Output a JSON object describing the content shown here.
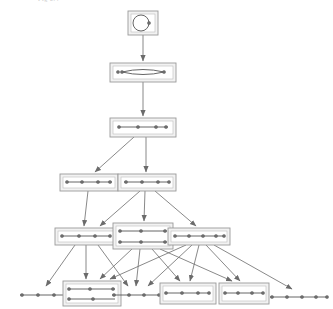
{
  "figure": {
    "type": "hierarchical-graph-lattice",
    "title_fragment": "Fig 2.4",
    "background_color": "#ffffff",
    "node_fill": "#f2f2f2",
    "node_stroke": "#9a9a9a",
    "graph_stroke": "#555555",
    "vertex_fill": "#6e6e6e",
    "edge_color": "#6b6b6b",
    "levels": 6,
    "node_count": 14,
    "edge_count": 25
  },
  "nodes": [
    {
      "id": "n0",
      "label": "level-0-single-vertex-graph",
      "level": 0,
      "x": 128,
      "y": 11,
      "w": 30,
      "h": 24,
      "kind": "cycle",
      "vertices": 2,
      "inner": {
        "type": "ellipse",
        "cx": 13,
        "cy": 12,
        "rx": 8,
        "ry": 8
      },
      "dots": [
        [
          21,
          12
        ]
      ]
    },
    {
      "id": "n1",
      "label": "level-1-lens-graph",
      "level": 1,
      "x": 110,
      "y": 63,
      "w": 66,
      "h": 19,
      "kind": "lens",
      "vertices": 3,
      "inner": {
        "type": "lens",
        "x1": 12,
        "x2": 54,
        "cy": 9,
        "ry": 5
      },
      "dots": [
        [
          12,
          9
        ],
        [
          54,
          9
        ],
        [
          8,
          9
        ]
      ]
    },
    {
      "id": "n2",
      "label": "level-2-path-graph",
      "level": 2,
      "x": 110,
      "y": 118,
      "w": 66,
      "h": 19,
      "kind": "path",
      "vertices": 4,
      "inner": {
        "type": "path",
        "y": 9,
        "x1": 8,
        "x2": 58
      },
      "dots": [
        [
          9,
          9
        ],
        [
          28,
          9
        ],
        [
          46,
          9
        ],
        [
          56,
          9
        ]
      ]
    },
    {
      "id": "n3",
      "label": "level-3-left-path-graph",
      "level": 3,
      "x": 60,
      "y": 174,
      "w": 58,
      "h": 17,
      "kind": "path",
      "vertices": 4,
      "inner": {
        "type": "path",
        "y": 8,
        "x1": 6,
        "x2": 52
      },
      "dots": [
        [
          7,
          8
        ],
        [
          22,
          8
        ],
        [
          38,
          8
        ],
        [
          50,
          8
        ]
      ]
    },
    {
      "id": "n4",
      "label": "level-3-right-path-graph",
      "level": 3,
      "x": 118,
      "y": 174,
      "w": 58,
      "h": 17,
      "kind": "path",
      "vertices": 4,
      "inner": {
        "type": "path",
        "y": 8,
        "x1": 6,
        "x2": 52
      },
      "dots": [
        [
          8,
          8
        ],
        [
          24,
          8
        ],
        [
          40,
          8
        ],
        [
          51,
          8
        ]
      ]
    },
    {
      "id": "n5",
      "label": "level-4-left-path-graph",
      "level": 4,
      "x": 55,
      "y": 228,
      "w": 62,
      "h": 17,
      "kind": "path",
      "vertices": 4,
      "inner": {
        "type": "path",
        "y": 8,
        "x1": 6,
        "x2": 56
      },
      "dots": [
        [
          7,
          8
        ],
        [
          24,
          8
        ],
        [
          40,
          8
        ],
        [
          55,
          8
        ]
      ]
    },
    {
      "id": "n6",
      "label": "level-4-center-double-graph",
      "level": 4,
      "x": 113,
      "y": 223,
      "w": 60,
      "h": 26,
      "kind": "double-path",
      "vertices": 6,
      "inner": {
        "type": "double-path",
        "y1": 8,
        "y2": 19,
        "x1": 6,
        "x2": 54
      },
      "dots": [
        [
          7,
          8
        ],
        [
          28,
          8
        ],
        [
          52,
          8
        ],
        [
          7,
          19
        ],
        [
          28,
          19
        ],
        [
          52,
          19
        ]
      ]
    },
    {
      "id": "n7",
      "label": "level-4-right-path-graph",
      "level": 4,
      "x": 168,
      "y": 228,
      "w": 62,
      "h": 17,
      "kind": "path",
      "vertices": 5,
      "inner": {
        "type": "path",
        "y": 8,
        "x1": 6,
        "x2": 56
      },
      "dots": [
        [
          7,
          8
        ],
        [
          21,
          8
        ],
        [
          35,
          8
        ],
        [
          48,
          8
        ],
        [
          56,
          8
        ]
      ]
    },
    {
      "id": "n8",
      "label": "level-5-path-graph-1",
      "level": 5,
      "x": 18,
      "y": 288,
      "w": 62,
      "h": 14,
      "kind": "path-bare",
      "vertices": 5,
      "inner": {
        "type": "path",
        "y": 7,
        "x1": 2,
        "x2": 60
      },
      "dots": [
        [
          4,
          7
        ],
        [
          20,
          7
        ],
        [
          36,
          7
        ],
        [
          52,
          7
        ],
        [
          59,
          7
        ]
      ]
    },
    {
      "id": "n9",
      "label": "level-5-double-graph",
      "level": 5,
      "x": 63,
      "y": 281,
      "w": 58,
      "h": 25,
      "kind": "double-path",
      "vertices": 5,
      "inner": {
        "type": "double-path",
        "y1": 8,
        "y2": 18,
        "x1": 5,
        "x2": 52
      },
      "dots": [
        [
          6,
          8
        ],
        [
          27,
          8
        ],
        [
          50,
          8
        ],
        [
          6,
          18
        ],
        [
          30,
          18
        ]
      ]
    },
    {
      "id": "n10",
      "label": "level-5-path-graph-2",
      "level": 5,
      "x": 110,
      "y": 288,
      "w": 62,
      "h": 14,
      "kind": "path-bare",
      "vertices": 5,
      "inner": {
        "type": "path",
        "y": 7,
        "x1": 2,
        "x2": 60
      },
      "dots": [
        [
          4,
          7
        ],
        [
          19,
          7
        ],
        [
          34,
          7
        ],
        [
          49,
          7
        ],
        [
          59,
          7
        ]
      ]
    },
    {
      "id": "n11",
      "label": "level-5-path-graph-3",
      "level": 5,
      "x": 160,
      "y": 283,
      "w": 56,
      "h": 21,
      "kind": "path",
      "vertices": 4,
      "inner": {
        "type": "path",
        "y": 10,
        "x1": 5,
        "x2": 50
      },
      "dots": [
        [
          6,
          10
        ],
        [
          22,
          10
        ],
        [
          38,
          10
        ],
        [
          49,
          10
        ]
      ]
    },
    {
      "id": "n12",
      "label": "level-5-path-graph-4",
      "level": 5,
      "x": 219,
      "y": 283,
      "w": 50,
      "h": 21,
      "kind": "path",
      "vertices": 4,
      "inner": {
        "type": "path",
        "y": 10,
        "x1": 5,
        "x2": 45
      },
      "dots": [
        [
          6,
          10
        ],
        [
          19,
          10
        ],
        [
          33,
          10
        ],
        [
          44,
          10
        ]
      ]
    },
    {
      "id": "n13",
      "label": "level-5-path-graph-5",
      "level": 5,
      "x": 268,
      "y": 291,
      "w": 62,
      "h": 12,
      "kind": "path-bare",
      "vertices": 5,
      "inner": {
        "type": "path",
        "y": 6,
        "x1": 2,
        "x2": 60
      },
      "dots": [
        [
          4,
          6
        ],
        [
          19,
          6
        ],
        [
          34,
          6
        ],
        [
          48,
          6
        ],
        [
          59,
          6
        ]
      ]
    }
  ],
  "edges": [
    {
      "from": "n0",
      "to": "n1",
      "x1": 143,
      "y1": 35,
      "x2": 143,
      "y2": 61
    },
    {
      "from": "n1",
      "to": "n2",
      "x1": 143,
      "y1": 82,
      "x2": 143,
      "y2": 116
    },
    {
      "from": "n2",
      "to": "n3",
      "x1": 134,
      "y1": 137,
      "x2": 95,
      "y2": 172
    },
    {
      "from": "n2",
      "to": "n4",
      "x1": 146,
      "y1": 137,
      "x2": 146,
      "y2": 172
    },
    {
      "from": "n3",
      "to": "n5",
      "x1": 88,
      "y1": 191,
      "x2": 84,
      "y2": 226
    },
    {
      "from": "n4",
      "to": "n5",
      "x1": 140,
      "y1": 191,
      "x2": 100,
      "y2": 226
    },
    {
      "from": "n4",
      "to": "n6",
      "x1": 145,
      "y1": 191,
      "x2": 144,
      "y2": 221
    },
    {
      "from": "n4",
      "to": "n7",
      "x1": 155,
      "y1": 191,
      "x2": 196,
      "y2": 226
    },
    {
      "from": "n5",
      "to": "n8",
      "x1": 75,
      "y1": 245,
      "x2": 46,
      "y2": 286
    },
    {
      "from": "n5",
      "to": "n9",
      "x1": 86,
      "y1": 245,
      "x2": 86,
      "y2": 279
    },
    {
      "from": "n5",
      "to": "n10",
      "x1": 98,
      "y1": 245,
      "x2": 128,
      "y2": 286
    },
    {
      "from": "n6",
      "to": "n9",
      "x1": 132,
      "y1": 249,
      "x2": 100,
      "y2": 279
    },
    {
      "from": "n6",
      "to": "n10",
      "x1": 140,
      "y1": 249,
      "x2": 136,
      "y2": 286
    },
    {
      "from": "n6",
      "to": "n11",
      "x1": 152,
      "y1": 249,
      "x2": 180,
      "y2": 281
    },
    {
      "from": "n6",
      "to": "n12",
      "x1": 160,
      "y1": 249,
      "x2": 232,
      "y2": 281
    },
    {
      "from": "n7",
      "to": "n9",
      "x1": 186,
      "y1": 245,
      "x2": 110,
      "y2": 279
    },
    {
      "from": "n7",
      "to": "n10",
      "x1": 192,
      "y1": 245,
      "x2": 148,
      "y2": 286
    },
    {
      "from": "n7",
      "to": "n11",
      "x1": 199,
      "y1": 245,
      "x2": 190,
      "y2": 281
    },
    {
      "from": "n7",
      "to": "n12",
      "x1": 206,
      "y1": 245,
      "x2": 240,
      "y2": 281
    },
    {
      "from": "n7",
      "to": "n13",
      "x1": 214,
      "y1": 245,
      "x2": 292,
      "y2": 289
    }
  ]
}
